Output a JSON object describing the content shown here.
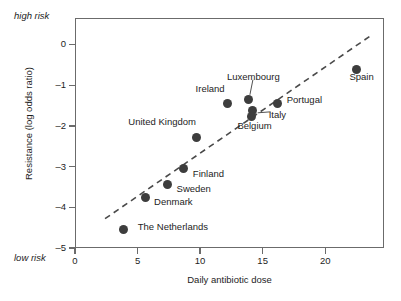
{
  "chart_data": {
    "type": "scatter",
    "title": "",
    "xlabel": "Daily antibiotic dose",
    "ylabel": "Resistance (log odds ratio)",
    "xlim": [
      0,
      24.7
    ],
    "ylim": [
      -5.0,
      0.65
    ],
    "grid": false,
    "legend": "none",
    "xticks": [
      0,
      5,
      10,
      15,
      20
    ],
    "xtick_labels": [
      "0",
      "5",
      "10",
      "15",
      "20"
    ],
    "yticks": [
      0,
      -1,
      -2,
      -3,
      -4,
      -5
    ],
    "ytick_labels": [
      "0",
      "–1",
      "–2",
      "–3",
      "–4",
      "–5"
    ],
    "annotations": {
      "axis_top": "high risk",
      "axis_bottom": "low risk"
    },
    "points": [
      {
        "label": "The Netherlands",
        "x": 3.9,
        "y": -4.55,
        "label_dx": 14,
        "label_dy": -3,
        "leader": false
      },
      {
        "label": "Denmark",
        "x": 5.6,
        "y": -3.76,
        "label_dx": 9,
        "label_dy": 4,
        "leader": false
      },
      {
        "label": "Sweden",
        "x": 7.4,
        "y": -3.43,
        "label_dx": 9,
        "label_dy": 5,
        "leader": false
      },
      {
        "label": "Finland",
        "x": 8.7,
        "y": -3.05,
        "label_dx": 9,
        "label_dy": 5,
        "leader": false
      },
      {
        "label": "United Kingdom",
        "x": 9.7,
        "y": -2.28,
        "label_dx": -68,
        "label_dy": -15,
        "leader": false
      },
      {
        "label": "Ireland",
        "x": 12.2,
        "y": -1.44,
        "label_dx": -32,
        "label_dy": -14,
        "leader": false
      },
      {
        "label": "Luxembourg",
        "x": 13.9,
        "y": -1.36,
        "label_dx": -22,
        "label_dy": -23,
        "leader": true
      },
      {
        "label": "Italy",
        "x": 14.2,
        "y": -1.63,
        "label_dx": 16,
        "label_dy": 4,
        "leader": true
      },
      {
        "label": "Belgium",
        "x": 14.1,
        "y": -1.76,
        "label_dx": -14,
        "label_dy": 10,
        "leader": false
      },
      {
        "label": "Portugal",
        "x": 16.2,
        "y": -1.44,
        "label_dx": 9,
        "label_dy": -3,
        "leader": false
      },
      {
        "label": "Spain",
        "x": 22.5,
        "y": -0.62,
        "label_dx": -7,
        "label_dy": 7,
        "leader": false
      }
    ],
    "trendline": {
      "style": "dashed",
      "x_start": 2.4,
      "y_start": -4.28,
      "x_end": 23.8,
      "y_end": 0.25
    }
  }
}
